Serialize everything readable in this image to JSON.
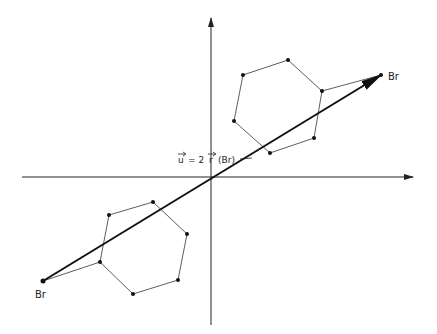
{
  "diagram": {
    "vector_label": "u = 2 r (Br)",
    "label_u": "u",
    "label_eq": "= 2",
    "label_r": "r",
    "label_arg": "(Br)",
    "endpoint_label_upper": "Br",
    "endpoint_label_lower": "Br",
    "colors": {
      "line": "#222222",
      "background": "#ffffff"
    },
    "axes": {
      "x": {
        "from": [
          22,
          177
        ],
        "to": [
          413,
          177
        ]
      },
      "y": {
        "from": [
          211,
          325
        ],
        "to": [
          211,
          18
        ]
      }
    },
    "vector": {
      "from": [
        43,
        281
      ],
      "to": [
        381,
        75
      ]
    },
    "hexagon_upper": [
      [
        288,
        60
      ],
      [
        322,
        91
      ],
      [
        314,
        138
      ],
      [
        270,
        153
      ],
      [
        234,
        121
      ],
      [
        243,
        75
      ]
    ],
    "hexagon_lower": [
      [
        153,
        202
      ],
      [
        187,
        234
      ],
      [
        178,
        280
      ],
      [
        133,
        294
      ],
      [
        100,
        262
      ],
      [
        109,
        215
      ]
    ],
    "connectors": [
      {
        "from": [
          322,
          91
        ],
        "to": [
          381,
          75
        ]
      },
      {
        "from": [
          100,
          262
        ],
        "to": [
          43,
          281
        ]
      }
    ]
  }
}
